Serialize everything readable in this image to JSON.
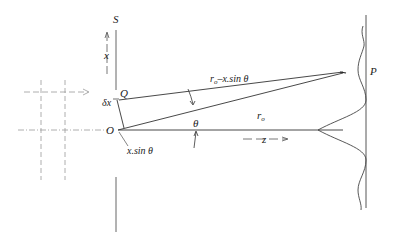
{
  "diagram": {
    "labels": {
      "S": "S",
      "x": "x",
      "Q": "Q",
      "dx": "δx",
      "O": "O",
      "xsin": "x.sin θ",
      "theta": "θ",
      "r0_minus": "r",
      "r0_minus_sub": "o",
      "r0_minus_rest": "–x.sin θ",
      "r0": "r",
      "r0_sub": "o",
      "z": "z",
      "P": "P"
    },
    "colors": {
      "line": "#333333",
      "dashed": "#888888",
      "curve": "#444444"
    }
  }
}
